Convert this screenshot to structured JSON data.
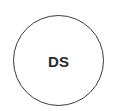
{
  "avatar": {
    "initials": "DS",
    "border_color": "#3a3a3a",
    "text_color": "#2b2b2b",
    "background": "#ffffff"
  }
}
